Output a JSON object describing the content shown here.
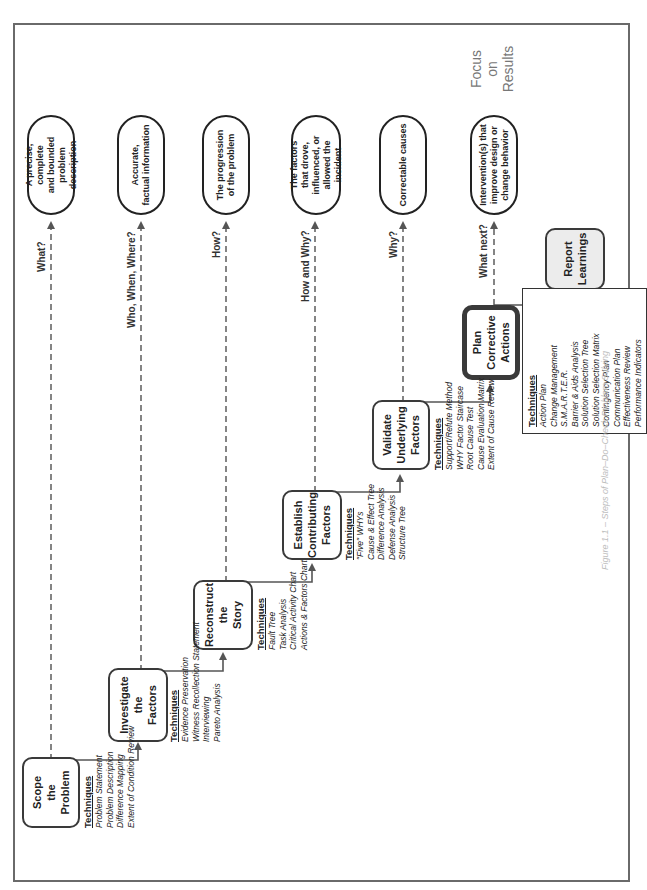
{
  "diagram": {
    "orientation": "rotated 90 degrees counter-clockwise",
    "focus_label": [
      "Focus",
      "on",
      "Results"
    ],
    "caption": "Figure 1.1 – Steps of Plan–Do–Check Problem Solving",
    "steps": [
      {
        "id": "scope",
        "label": [
          "Scope",
          "the",
          "Problem"
        ],
        "question": "What?",
        "outcome": [
          "A precise, complete",
          "and bounded",
          "problem description"
        ],
        "techniques_heading": "Techniques",
        "techniques": [
          "Problem Statement",
          "Problem Description",
          "Difference Mapping",
          "Extent of Condition Review"
        ]
      },
      {
        "id": "investigate",
        "label": [
          "Investigate",
          "the",
          "Factors"
        ],
        "question": "Who, When, Where?",
        "outcome": [
          "Accurate,",
          "factual information"
        ],
        "techniques_heading": "Techniques",
        "techniques": [
          "Evidence Preservation",
          "Witness Recollection Statement",
          "Interviewing",
          "Pareto Analysis"
        ]
      },
      {
        "id": "reconstruct",
        "label": [
          "Reconstruct",
          "the",
          "Story"
        ],
        "question": "How?",
        "outcome": [
          "The progression",
          "of the problem"
        ],
        "techniques_heading": "Techniques",
        "techniques": [
          "Fault Tree",
          "Task Analysis",
          "Critical Activity Chart",
          "Actions & Factors Chart"
        ]
      },
      {
        "id": "establish",
        "label": [
          "Establish",
          "Contributing",
          "Factors"
        ],
        "question": "How and Why?",
        "outcome": [
          "The factors",
          "that drove,",
          "influenced, or",
          "allowed the incident"
        ],
        "techniques_heading": "Techniques",
        "techniques": [
          "\"Five\" WHYs",
          "Cause & Effect Tree",
          "Difference Analysis",
          "Defense Analysis",
          "Structure Tree"
        ]
      },
      {
        "id": "validate",
        "label": [
          "Validate",
          "Underlying",
          "Factors"
        ],
        "question": "Why?",
        "outcome": [
          "Correctable causes"
        ],
        "techniques_heading": "Techniques",
        "techniques": [
          "Support/Refute Method",
          "WHY Factor Staircase",
          "Root Cause Test",
          "Cause Evaluation Matrix",
          "Extent of Cause Review"
        ]
      },
      {
        "id": "plan",
        "label": [
          "Plan",
          "Corrective",
          "Actions"
        ],
        "question": "What next?",
        "outcome": [
          "Intervention(s) that",
          "improve design or",
          "change behavior"
        ],
        "techniques_heading": "Techniques",
        "techniques": [
          "Action Plan",
          "Change Management",
          "S.M.A.R.T.E.R.",
          "Barrier & Aids Analysis",
          "Solution Selection Tree",
          "Solution Selection Matrix",
          "Contingency Plan",
          "Communication Plan",
          "Effectiveness Review",
          "Performance Indicators"
        ]
      },
      {
        "id": "report",
        "label": [
          "Report",
          "Learnings"
        ]
      }
    ]
  }
}
